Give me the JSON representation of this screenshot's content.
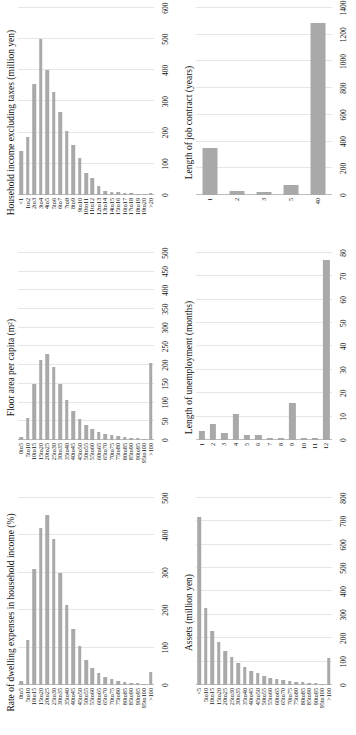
{
  "figure": {
    "orientation": "rotated-90-ccw",
    "bar_color": "#a9a9a9",
    "gridline_color": "#e6e6e6",
    "background": "#ffffff",
    "panel_count": 6
  },
  "chart_data": [
    {
      "type": "bar",
      "orientation": "horizontal",
      "panel": "top-left",
      "title": "Rate of dwelling expenses in household income (%)",
      "xlabel": "",
      "ylabel": "",
      "grid": true,
      "legend": null,
      "xlim": [
        0,
        500
      ],
      "xticks": [
        0,
        100,
        200,
        300,
        400,
        500
      ],
      "categories": [
        "0to5",
        "5to10",
        "10to15",
        "15to20",
        "20to25",
        "25to30",
        "30to35",
        "35to40",
        "40to45",
        "45to50",
        "50to55",
        "55to60",
        "60to65",
        "65to70",
        "70to75",
        "75to80",
        "80to85",
        "85to90",
        "90to95",
        "95to100",
        ">100"
      ],
      "values": [
        12,
        120,
        310,
        420,
        455,
        390,
        300,
        215,
        150,
        105,
        68,
        45,
        32,
        22,
        16,
        12,
        9,
        6,
        5,
        4,
        34
      ]
    },
    {
      "type": "bar",
      "orientation": "horizontal",
      "panel": "top-middle",
      "title": "Floor area per capita (m²)",
      "xlabel": "",
      "ylabel": "",
      "grid": true,
      "legend": null,
      "xlim": [
        0,
        500
      ],
      "xticks": [
        0,
        50,
        100,
        150,
        200,
        250,
        300,
        350,
        400,
        450,
        500
      ],
      "categories": [
        "0to5",
        "5to10",
        "10to15",
        "15to20",
        "20to25",
        "25to30",
        "30to35",
        "35to40",
        "40to45",
        "45to50",
        "50to55",
        "55to60",
        "60to65",
        "65to70",
        "70to75",
        "75to80",
        "80to85",
        "85to90",
        "90to95",
        "95to100",
        ">100"
      ],
      "values": [
        8,
        60,
        150,
        215,
        230,
        195,
        150,
        108,
        78,
        56,
        40,
        30,
        22,
        17,
        13,
        10,
        8,
        6,
        5,
        4,
        205
      ]
    },
    {
      "type": "bar",
      "orientation": "horizontal",
      "panel": "top-right",
      "title": "Household income excluding taxes (million yen)",
      "xlabel": "",
      "ylabel": "",
      "grid": true,
      "legend": null,
      "xlim": [
        0,
        600
      ],
      "xticks": [
        0,
        100,
        200,
        300,
        400,
        500,
        600
      ],
      "categories": [
        "<1",
        "1to2",
        "2to3",
        "3to4",
        "4to5",
        "5to6",
        "6to7",
        "7to8",
        "8to9",
        "9to10",
        "10to11",
        "11to12",
        "12to13",
        "13to14",
        "14to15",
        "15to16",
        "16to17",
        "17to18",
        "18to19",
        "19to20",
        ">20"
      ],
      "values": [
        140,
        185,
        355,
        500,
        400,
        330,
        265,
        205,
        160,
        120,
        70,
        55,
        30,
        12,
        10,
        10,
        5,
        5,
        4,
        4,
        8
      ]
    },
    {
      "type": "bar",
      "orientation": "horizontal",
      "panel": "bottom-left",
      "title": "Assets (million yen)",
      "xlabel": "",
      "ylabel": "",
      "grid": true,
      "legend": null,
      "xlim": [
        0,
        800
      ],
      "xticks": [
        0,
        100,
        200,
        300,
        400,
        500,
        600,
        700,
        800
      ],
      "categories": [
        "<5",
        "5to10",
        "10to15",
        "15to20",
        "20to25",
        "25to30",
        "30to35",
        "35to40",
        "40to45",
        "45to50",
        "50to55",
        "55to60",
        "60to65",
        "65to70",
        "70to75",
        "75to80",
        "80to85",
        "85to90",
        "90to95",
        "95to100",
        ">100"
      ],
      "values": [
        720,
        330,
        230,
        185,
        145,
        120,
        95,
        78,
        62,
        50,
        40,
        32,
        26,
        21,
        17,
        14,
        11,
        9,
        7,
        6,
        115
      ]
    },
    {
      "type": "bar",
      "orientation": "horizontal",
      "panel": "bottom-middle",
      "title": "Length of unemployment (months)",
      "xlabel": "",
      "ylabel": "",
      "grid": true,
      "legend": null,
      "xlim": [
        0,
        80
      ],
      "xticks": [
        0,
        10,
        20,
        30,
        40,
        50,
        60,
        70,
        80
      ],
      "categories": [
        "1",
        "2",
        "3",
        "4",
        "5",
        "6",
        "7",
        "8",
        "9",
        "10",
        "11",
        "12"
      ],
      "values": [
        4,
        7,
        3,
        11,
        2,
        2,
        1,
        1,
        16,
        1,
        1,
        77
      ]
    },
    {
      "type": "bar",
      "orientation": "horizontal",
      "panel": "bottom-right",
      "title": "Length of job contract (years)",
      "xlabel": "",
      "ylabel": "",
      "grid": true,
      "legend": null,
      "xlim": [
        0,
        1400
      ],
      "xticks": [
        0,
        200,
        400,
        600,
        800,
        1000,
        1200,
        1400
      ],
      "categories": [
        "1",
        "2",
        "3",
        "5",
        "40"
      ],
      "values": [
        350,
        28,
        22,
        75,
        1290
      ]
    }
  ]
}
